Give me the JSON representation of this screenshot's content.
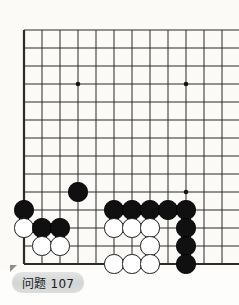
{
  "caption": {
    "label": "问题 107",
    "corner_marker_color": "#8d8f8c",
    "pill_color": "#d8dbda"
  },
  "board": {
    "background_color": "#fbfaf6",
    "line_color": "#2b2b2b",
    "star_point_color": "#141414",
    "origin_x": 24,
    "origin_y": 30,
    "spacing": 18.0,
    "cols": 12,
    "rows": 13,
    "stone_radius": 9.6,
    "line_width": 1.0,
    "edge_line_width": 2.2,
    "star_points": [
      {
        "col": 3,
        "row": 3
      },
      {
        "col": 9,
        "row": 3
      },
      {
        "col": 9,
        "row": 9
      }
    ],
    "edges": {
      "left": true,
      "bottom": true,
      "top": false,
      "right": false
    },
    "stones": [
      {
        "color": "black",
        "col": 3,
        "row": 9
      },
      {
        "color": "black",
        "col": 0,
        "row": 10
      },
      {
        "color": "black",
        "col": 5,
        "row": 10
      },
      {
        "color": "black",
        "col": 6,
        "row": 10
      },
      {
        "color": "black",
        "col": 7,
        "row": 10
      },
      {
        "color": "black",
        "col": 8,
        "row": 10
      },
      {
        "color": "black",
        "col": 9,
        "row": 10
      },
      {
        "color": "white",
        "col": 0,
        "row": 11
      },
      {
        "color": "black",
        "col": 1,
        "row": 11
      },
      {
        "color": "black",
        "col": 2,
        "row": 11
      },
      {
        "color": "white",
        "col": 5,
        "row": 11
      },
      {
        "color": "white",
        "col": 6,
        "row": 11
      },
      {
        "color": "white",
        "col": 7,
        "row": 11
      },
      {
        "color": "black",
        "col": 9,
        "row": 11
      },
      {
        "color": "white",
        "col": 1,
        "row": 12
      },
      {
        "color": "white",
        "col": 2,
        "row": 12
      },
      {
        "color": "white",
        "col": 7,
        "row": 12
      },
      {
        "color": "black",
        "col": 9,
        "row": 12
      },
      {
        "color": "white",
        "col": 5,
        "row": 13
      },
      {
        "color": "white",
        "col": 6,
        "row": 13
      },
      {
        "color": "white",
        "col": 7,
        "row": 13
      },
      {
        "color": "black",
        "col": 9,
        "row": 13
      }
    ]
  }
}
